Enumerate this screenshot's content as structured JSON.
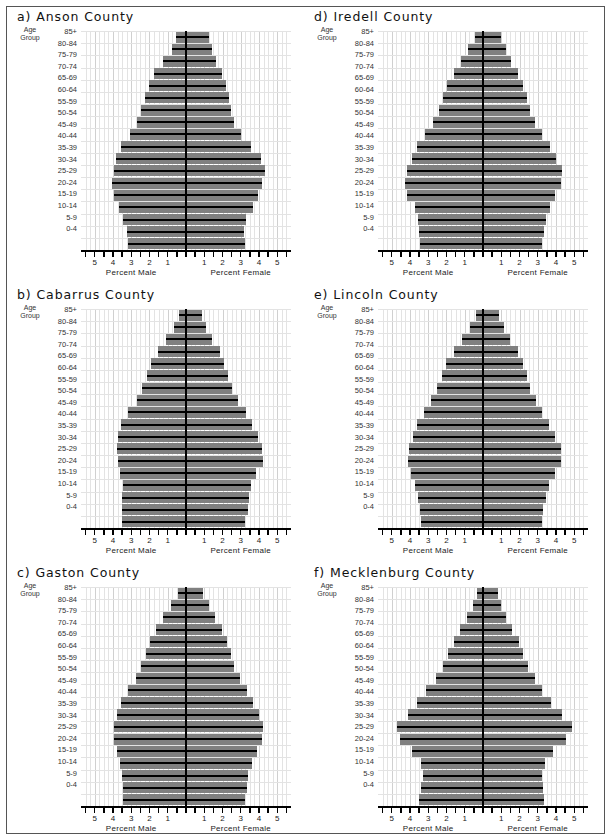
{
  "figure": {
    "age_groups": [
      "85+",
      "80-84",
      "75-79",
      "70-74",
      "65-69",
      "60-64",
      "55-59",
      "50-54",
      "45-49",
      "40-44",
      "35-39",
      "30-34",
      "25-29",
      "20-24",
      "15-19",
      "10-14",
      "5-9",
      "0-4"
    ],
    "age_group_header_line1": "Age",
    "age_group_header_line2": "Group",
    "xaxis_left_label": "Percent Male",
    "xaxis_right_label": "Percent Female",
    "tick_labels": [
      "5",
      "4",
      "3",
      "2",
      "1",
      "1",
      "2",
      "3",
      "4",
      "5"
    ],
    "xlim": [
      -5.75,
      5.75
    ],
    "bar_color": "#808080",
    "line_color": "#000000",
    "grid_color": "#e3e3e3",
    "background_color": "#ffffff"
  },
  "chart_data": [
    {
      "type": "bar",
      "title": "a) Anson County",
      "panel_letter": "a)",
      "county": "Anson County",
      "xlabel": "Percent Male / Percent Female",
      "ylabel": "Age Group",
      "xlim": [
        -5.75,
        5.75
      ],
      "grid": true,
      "categories": [
        "85+",
        "80-84",
        "75-79",
        "70-74",
        "65-69",
        "60-64",
        "55-59",
        "50-54",
        "45-49",
        "40-44",
        "35-39",
        "30-34",
        "25-29",
        "20-24",
        "15-19",
        "10-14",
        "5-9",
        "0-4"
      ],
      "series": [
        {
          "name": "Percent Male",
          "values": [
            0.55,
            0.75,
            1.25,
            1.75,
            2.05,
            2.25,
            2.45,
            2.7,
            3.05,
            3.55,
            3.85,
            3.95,
            4.05,
            3.95,
            3.65,
            3.45,
            3.25,
            3.15
          ]
        },
        {
          "name": "Percent Female",
          "values": [
            1.25,
            1.4,
            1.65,
            1.95,
            2.2,
            2.35,
            2.45,
            2.65,
            3.0,
            3.55,
            4.1,
            4.3,
            4.15,
            3.95,
            3.65,
            3.3,
            3.2,
            3.25
          ]
        }
      ]
    },
    {
      "type": "bar",
      "title": "b) Cabarrus County",
      "panel_letter": "b)",
      "county": "Cabarrus County",
      "xlabel": "Percent Male / Percent Female",
      "ylabel": "Age Group",
      "xlim": [
        -5.75,
        5.75
      ],
      "grid": true,
      "categories": [
        "85+",
        "80-84",
        "75-79",
        "70-74",
        "65-69",
        "60-64",
        "55-59",
        "50-54",
        "45-49",
        "40-44",
        "35-39",
        "30-34",
        "25-29",
        "20-24",
        "15-19",
        "10-14",
        "5-9",
        "0-4"
      ],
      "series": [
        {
          "name": "Percent Male",
          "values": [
            0.4,
            0.65,
            1.1,
            1.55,
            1.9,
            2.15,
            2.4,
            2.7,
            3.15,
            3.55,
            3.7,
            3.8,
            3.75,
            3.6,
            3.45,
            3.5,
            3.5,
            3.5
          ]
        },
        {
          "name": "Percent Female",
          "values": [
            0.85,
            1.1,
            1.45,
            1.85,
            2.1,
            2.3,
            2.5,
            2.85,
            3.3,
            3.6,
            3.95,
            4.15,
            4.2,
            3.85,
            3.55,
            3.45,
            3.4,
            3.25
          ]
        }
      ]
    },
    {
      "type": "bar",
      "title": "c) Gaston County",
      "panel_letter": "c)",
      "county": "Gaston County",
      "xlabel": "Percent Male / Percent Female",
      "ylabel": "Age Group",
      "xlim": [
        -5.75,
        5.75
      ],
      "grid": true,
      "categories": [
        "85+",
        "80-84",
        "75-79",
        "70-74",
        "65-69",
        "60-64",
        "55-59",
        "50-54",
        "45-49",
        "40-44",
        "35-39",
        "30-34",
        "25-29",
        "20-24",
        "15-19",
        "10-14",
        "5-9",
        "0-4"
      ],
      "series": [
        {
          "name": "Percent Male",
          "values": [
            0.45,
            0.8,
            1.25,
            1.65,
            1.95,
            2.2,
            2.45,
            2.75,
            3.15,
            3.55,
            3.8,
            3.95,
            3.95,
            3.8,
            3.6,
            3.5,
            3.45,
            3.45
          ]
        },
        {
          "name": "Percent Female",
          "values": [
            0.95,
            1.25,
            1.6,
            1.95,
            2.25,
            2.45,
            2.65,
            2.95,
            3.35,
            3.65,
            4.0,
            4.2,
            4.15,
            3.9,
            3.6,
            3.4,
            3.35,
            3.25
          ]
        }
      ]
    },
    {
      "type": "bar",
      "title": "d) Iredell County",
      "panel_letter": "d)",
      "county": "Iredell County",
      "xlabel": "Percent Male / Percent Female",
      "ylabel": "Age Group",
      "xlim": [
        -5.75,
        5.75
      ],
      "grid": true,
      "categories": [
        "85+",
        "80-84",
        "75-79",
        "70-74",
        "65-69",
        "60-64",
        "55-59",
        "50-54",
        "45-49",
        "40-44",
        "35-39",
        "30-34",
        "25-29",
        "20-24",
        "15-19",
        "10-14",
        "5-9",
        "0-4"
      ],
      "series": [
        {
          "name": "Percent Male",
          "values": [
            0.45,
            0.8,
            1.2,
            1.6,
            1.95,
            2.2,
            2.4,
            2.75,
            3.2,
            3.6,
            3.9,
            4.15,
            4.25,
            4.15,
            3.75,
            3.55,
            3.5,
            3.45
          ]
        },
        {
          "name": "Percent Female",
          "values": [
            1.0,
            1.25,
            1.55,
            1.9,
            2.2,
            2.4,
            2.55,
            2.85,
            3.25,
            3.65,
            4.0,
            4.3,
            4.25,
            3.95,
            3.65,
            3.45,
            3.35,
            3.25
          ]
        }
      ]
    },
    {
      "type": "bar",
      "title": "e) Lincoln County",
      "panel_letter": "e)",
      "county": "Lincoln County",
      "xlabel": "Percent Male / Percent Female",
      "ylabel": "Age Group",
      "xlim": [
        -5.75,
        5.75
      ],
      "grid": true,
      "categories": [
        "85+",
        "80-84",
        "75-79",
        "70-74",
        "65-69",
        "60-64",
        "55-59",
        "50-54",
        "45-49",
        "40-44",
        "35-39",
        "30-34",
        "25-29",
        "20-24",
        "15-19",
        "10-14",
        "5-9",
        "0-4"
      ],
      "series": [
        {
          "name": "Percent Male",
          "values": [
            0.4,
            0.7,
            1.15,
            1.6,
            2.0,
            2.25,
            2.5,
            2.85,
            3.25,
            3.6,
            3.85,
            4.05,
            4.1,
            3.95,
            3.7,
            3.55,
            3.45,
            3.4
          ]
        },
        {
          "name": "Percent Female",
          "values": [
            0.9,
            1.15,
            1.5,
            1.9,
            2.2,
            2.4,
            2.6,
            2.9,
            3.25,
            3.6,
            3.95,
            4.25,
            4.25,
            3.95,
            3.6,
            3.45,
            3.3,
            3.25
          ]
        }
      ]
    },
    {
      "type": "bar",
      "title": "f) Mecklenburg County",
      "panel_letter": "f)",
      "county": "Mecklenburg County",
      "xlabel": "Percent Male / Percent Female",
      "ylabel": "Age Group",
      "xlim": [
        -5.75,
        5.75
      ],
      "grid": true,
      "categories": [
        "85+",
        "80-84",
        "75-79",
        "70-74",
        "65-69",
        "60-64",
        "55-59",
        "50-54",
        "45-49",
        "40-44",
        "35-39",
        "30-34",
        "25-29",
        "20-24",
        "15-19",
        "10-14",
        "5-9",
        "0-4"
      ],
      "series": [
        {
          "name": "Percent Male",
          "values": [
            0.35,
            0.55,
            0.85,
            1.25,
            1.6,
            1.9,
            2.2,
            2.6,
            3.1,
            3.6,
            4.1,
            4.7,
            4.55,
            3.9,
            3.4,
            3.3,
            3.4,
            3.5
          ]
        },
        {
          "name": "Percent Female",
          "values": [
            0.8,
            1.0,
            1.25,
            1.6,
            1.95,
            2.2,
            2.45,
            2.85,
            3.25,
            3.7,
            4.3,
            4.85,
            4.55,
            3.85,
            3.4,
            3.25,
            3.3,
            3.35
          ]
        }
      ]
    }
  ]
}
